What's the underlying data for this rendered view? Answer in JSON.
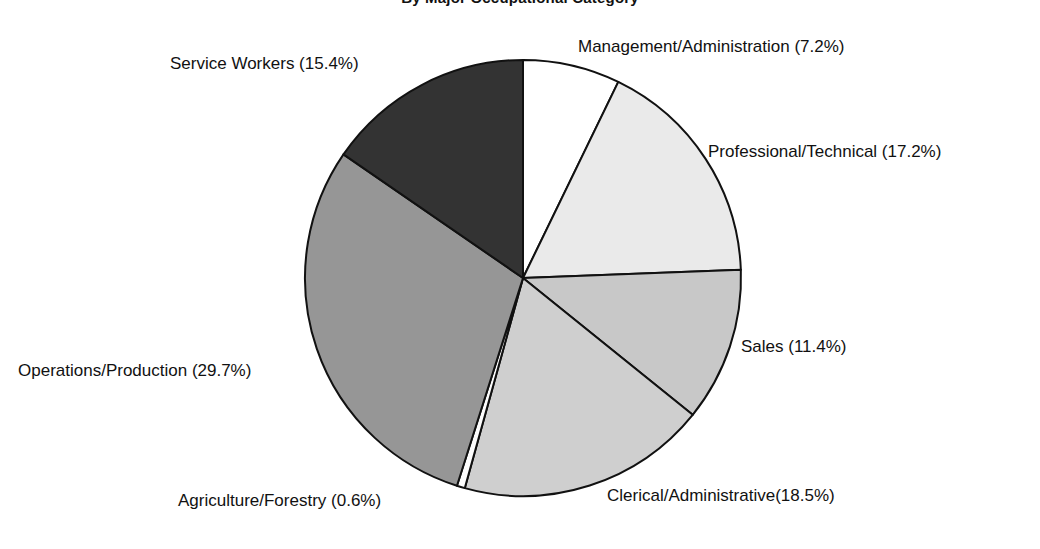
{
  "chart_data": {
    "type": "pie",
    "title": "By Major Occupational Category",
    "xlabel": "",
    "ylabel": "",
    "legend_position": "none",
    "grid": false,
    "start_angle_deg": 0,
    "direction": "clockwise",
    "units": "percent",
    "categories": [
      "Management/Administration",
      "Professional/Technical",
      "Sales",
      "Clerical/Administrative",
      "Agriculture/Forestry",
      "Operations/Production",
      "Service Workers"
    ],
    "values": [
      7.2,
      17.2,
      11.4,
      18.5,
      0.6,
      29.7,
      15.4
    ],
    "slices": [
      {
        "name": "Management/Administration",
        "value": 7.2,
        "label": "Management/Administration (7.2%)",
        "color": "#ffffff"
      },
      {
        "name": "Professional/Technical",
        "value": 17.2,
        "label": "Professional/Technical (17.2%)",
        "color": "#eaeaea"
      },
      {
        "name": "Sales",
        "value": 11.4,
        "label": "Sales (11.4%)",
        "color": "#c8c8c8"
      },
      {
        "name": "Clerical/Administrative",
        "value": 18.5,
        "label": "Clerical/Administrative(18.5%)",
        "color": "#cfcfcf"
      },
      {
        "name": "Agriculture/Forestry",
        "value": 0.6,
        "label": "Agriculture/Forestry (0.6%)",
        "color": "#fdfdfd"
      },
      {
        "name": "Operations/Production",
        "value": 29.7,
        "label": "Operations/Production (29.7%)",
        "color": "#969696"
      },
      {
        "name": "Service Workers",
        "value": 15.4,
        "label": "Service Workers (15.4%)",
        "color": "#333333"
      }
    ]
  },
  "style": {
    "outline_color": "#111111",
    "background": "#ffffff",
    "text_color": "#111111"
  }
}
